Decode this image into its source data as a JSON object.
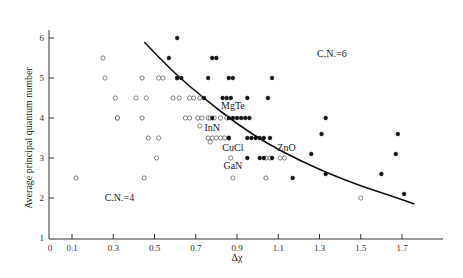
{
  "chart_data": {
    "type": "scatter",
    "title": "",
    "xlabel": "Δχ",
    "ylabel": "Average principal quantum number",
    "xlim": [
      0,
      1.82
    ],
    "ylim": [
      1,
      6.6
    ],
    "grid": false,
    "x_ticks": [
      {
        "value": 0,
        "label": "0"
      },
      {
        "value": 0.1,
        "label": "0.1"
      },
      {
        "value": 0.3,
        "label": "0.3"
      },
      {
        "value": 0.5,
        "label": "0.5"
      },
      {
        "value": 0.7,
        "label": "0.7"
      },
      {
        "value": 0.9,
        "label": "0.9"
      },
      {
        "value": 1.1,
        "label": "1.1"
      },
      {
        "value": 1.3,
        "label": "1.3"
      },
      {
        "value": 1.5,
        "label": "1.5"
      },
      {
        "value": 1.7,
        "label": "1.7"
      }
    ],
    "y_ticks": [
      {
        "value": 1,
        "label": "1"
      },
      {
        "value": 2,
        "label": "2"
      },
      {
        "value": 3,
        "label": "3"
      },
      {
        "value": 4,
        "label": "4"
      },
      {
        "value": 5,
        "label": "5"
      },
      {
        "value": 6,
        "label": "6"
      }
    ],
    "series": [
      {
        "name": "C.N.=4 (open circles)",
        "marker": "open-circle",
        "points": [
          [
            0.25,
            5.5
          ],
          [
            0.26,
            5.0
          ],
          [
            0.31,
            4.5
          ],
          [
            0.44,
            5.0
          ],
          [
            0.52,
            5.0
          ],
          [
            0.54,
            5.0
          ],
          [
            0.61,
            5.0
          ],
          [
            0.32,
            4.0
          ],
          [
            0.41,
            4.5
          ],
          [
            0.46,
            4.5
          ],
          [
            0.59,
            4.5
          ],
          [
            0.62,
            4.5
          ],
          [
            0.67,
            4.5
          ],
          [
            0.69,
            4.5
          ],
          [
            0.72,
            4.5
          ],
          [
            0.32,
            4.0
          ],
          [
            0.44,
            4.0
          ],
          [
            0.65,
            4.0
          ],
          [
            0.67,
            4.0
          ],
          [
            0.71,
            4.0
          ],
          [
            0.73,
            4.0
          ],
          [
            0.76,
            4.0
          ],
          [
            0.77,
            4.0
          ],
          [
            0.79,
            4.0
          ],
          [
            0.82,
            4.0
          ],
          [
            0.85,
            4.0
          ],
          [
            0.47,
            3.5
          ],
          [
            0.52,
            3.5
          ],
          [
            0.72,
            3.8
          ],
          [
            0.76,
            3.5
          ],
          [
            0.77,
            3.4
          ],
          [
            0.78,
            3.5
          ],
          [
            0.8,
            3.5
          ],
          [
            0.82,
            3.5
          ],
          [
            0.84,
            3.5
          ],
          [
            0.86,
            3.5
          ],
          [
            0.51,
            3.0
          ],
          [
            0.87,
            3.0
          ],
          [
            1.04,
            3.0
          ],
          [
            1.06,
            3.0
          ],
          [
            1.11,
            3.0
          ],
          [
            1.13,
            3.0
          ],
          [
            0.12,
            2.5
          ],
          [
            0.45,
            2.5
          ],
          [
            0.88,
            2.5
          ],
          [
            1.04,
            2.5
          ],
          [
            1.5,
            2.0
          ]
        ]
      },
      {
        "name": "C.N.=6 (filled circles)",
        "marker": "filled-circle",
        "points": [
          [
            0.61,
            6.0
          ],
          [
            0.57,
            5.5
          ],
          [
            0.78,
            5.5
          ],
          [
            0.8,
            5.5
          ],
          [
            0.61,
            5.0
          ],
          [
            0.63,
            5.0
          ],
          [
            0.76,
            5.0
          ],
          [
            0.86,
            5.0
          ],
          [
            0.88,
            5.0
          ],
          [
            1.07,
            5.0
          ],
          [
            0.74,
            4.5
          ],
          [
            0.83,
            4.5
          ],
          [
            0.85,
            4.5
          ],
          [
            0.87,
            4.5
          ],
          [
            0.95,
            4.5
          ],
          [
            1.05,
            4.5
          ],
          [
            0.78,
            4.0
          ],
          [
            0.86,
            4.0
          ],
          [
            0.88,
            4.0
          ],
          [
            0.9,
            4.0
          ],
          [
            0.92,
            4.0
          ],
          [
            0.94,
            4.0
          ],
          [
            0.96,
            4.0
          ],
          [
            0.86,
            3.5
          ],
          [
            0.95,
            3.5
          ],
          [
            0.97,
            3.5
          ],
          [
            0.99,
            3.5
          ],
          [
            1.01,
            3.5
          ],
          [
            1.03,
            3.5
          ],
          [
            1.06,
            3.5
          ],
          [
            0.95,
            3.0
          ],
          [
            1.01,
            3.0
          ],
          [
            1.03,
            3.0
          ],
          [
            1.07,
            3.0
          ],
          [
            1.33,
            4.0
          ],
          [
            1.31,
            3.6
          ],
          [
            1.68,
            3.6
          ],
          [
            1.26,
            3.1
          ],
          [
            1.67,
            3.1
          ],
          [
            1.17,
            2.5
          ],
          [
            1.33,
            2.6
          ],
          [
            1.6,
            2.6
          ],
          [
            1.71,
            2.1
          ]
        ]
      }
    ],
    "boundary_curve": {
      "name": "C.N. boundary",
      "points": [
        [
          0.45,
          5.9
        ],
        [
          0.6,
          5.1
        ],
        [
          0.75,
          4.45
        ],
        [
          0.9,
          3.85
        ],
        [
          1.05,
          3.35
        ],
        [
          1.2,
          2.95
        ],
        [
          1.35,
          2.6
        ],
        [
          1.5,
          2.3
        ],
        [
          1.65,
          2.05
        ],
        [
          1.76,
          1.85
        ]
      ]
    },
    "annotations": [
      {
        "text": "C.N.=6",
        "x": 1.36,
        "y": 5.6
      },
      {
        "text": "C.N.=4",
        "x": 0.33,
        "y": 2.0
      },
      {
        "text": "MgTe",
        "x": 0.88,
        "y": 4.3
      },
      {
        "text": "InN",
        "x": 0.78,
        "y": 3.75
      },
      {
        "text": "CuCl",
        "x": 0.88,
        "y": 3.25
      },
      {
        "text": "ZnO",
        "x": 1.14,
        "y": 3.25
      },
      {
        "text": "GaN",
        "x": 0.88,
        "y": 2.8
      }
    ]
  }
}
